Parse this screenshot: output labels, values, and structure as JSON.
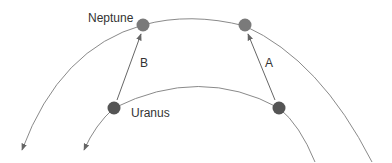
{
  "diagram": {
    "labels": {
      "neptune": "Neptune",
      "uranus": "Uranus",
      "arrow_a": "A",
      "arrow_b": "B"
    },
    "colors": {
      "orbit": "#8a8a8a",
      "neptune_planet": "#7a7a7a",
      "uranus_planet": "#555555",
      "arrow": "#555555",
      "text": "#333333"
    }
  }
}
